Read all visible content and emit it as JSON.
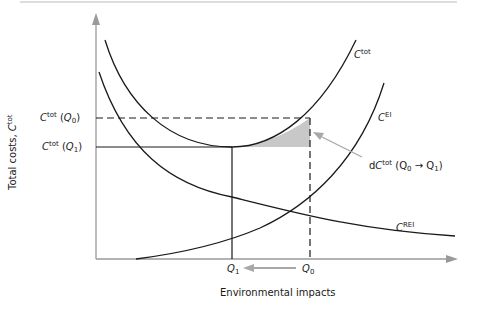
{
  "diagram": {
    "title": "",
    "y_axis_label": "Total costs, ",
    "y_axis_symbol": "C",
    "y_axis_superscript": "tot",
    "x_axis_label": "Environmental impacts",
    "curves": [
      {
        "name": "C",
        "sup": "tot",
        "label": "C tot"
      },
      {
        "name": "C",
        "sup": "EI",
        "label": "C EI"
      },
      {
        "name": "C",
        "sup": "REI",
        "label": "C REI"
      }
    ],
    "y_ticks": [
      {
        "sym": "C",
        "sup": "tot",
        "arg": "Q",
        "argsub": "0",
        "label": "C tot (Q0)"
      },
      {
        "sym": "C",
        "sup": "tot",
        "arg": "Q",
        "argsub": "1",
        "label": "C tot (Q1)"
      }
    ],
    "x_ticks": [
      {
        "sym": "Q",
        "sub": "1"
      },
      {
        "sym": "Q",
        "sub": "0"
      }
    ],
    "annotation": {
      "prefix": "d",
      "sym": "C",
      "sup": "tot",
      "from": "Q",
      "from_sub": "0",
      "arrow": "→",
      "to": "Q",
      "to_sub": "1"
    },
    "colors": {
      "axis": "#9a9a9a",
      "curve": "#1a1a1a",
      "shade": "#c8c8c8",
      "arrow": "#a8a8a8"
    }
  }
}
